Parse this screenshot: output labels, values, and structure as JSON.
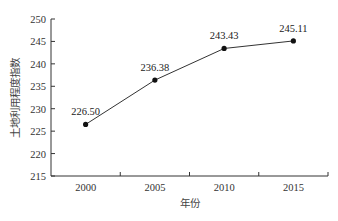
{
  "chart_data": {
    "type": "line",
    "title": "",
    "xlabel": "年份",
    "ylabel": "土地利用程度指数",
    "categories": [
      "2000",
      "2005",
      "2010",
      "2015"
    ],
    "values": [
      226.5,
      236.38,
      243.43,
      245.11
    ],
    "data_labels": [
      "226.50",
      "236.38",
      "243.43",
      "245.11"
    ],
    "ylim": [
      215,
      250
    ],
    "yticks": [
      "215",
      "220",
      "225",
      "230",
      "235",
      "240",
      "245",
      "250"
    ],
    "grid": false,
    "legend": null,
    "line_color": "#333333",
    "marker_color": "#111111"
  }
}
